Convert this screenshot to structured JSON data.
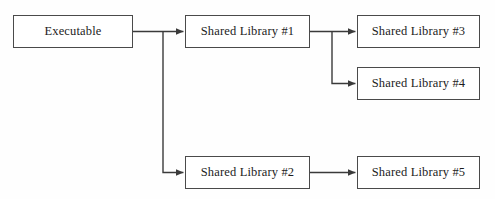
{
  "diagram": {
    "canvas": {
      "width": 495,
      "height": 199,
      "background": "#fefefe"
    },
    "style": {
      "box_border_color": "#4a4a4a",
      "box_fill_color": "#ffffff",
      "edge_color": "#3a3a3a",
      "text_color": "#1c1c1c",
      "edge_width": 1.4,
      "arrowhead": "solid-triangle"
    },
    "nodes": [
      {
        "id": "executable",
        "label": "Executable",
        "x": 13,
        "y": 15,
        "w": 120,
        "h": 33
      },
      {
        "id": "shared_library_1",
        "label": "Shared Library #1",
        "x": 185,
        "y": 15,
        "w": 125,
        "h": 33
      },
      {
        "id": "shared_library_3",
        "label": "Shared Library #3",
        "x": 357,
        "y": 15,
        "w": 123,
        "h": 33
      },
      {
        "id": "shared_library_4",
        "label": "Shared Library #4",
        "x": 357,
        "y": 67,
        "w": 123,
        "h": 33
      },
      {
        "id": "shared_library_2",
        "label": "Shared Library #2",
        "x": 185,
        "y": 156,
        "w": 125,
        "h": 33
      },
      {
        "id": "shared_library_5",
        "label": "Shared Library #5",
        "x": 357,
        "y": 156,
        "w": 123,
        "h": 33
      }
    ],
    "edges": [
      {
        "id": "edge-executable-to-sl1",
        "from": "executable",
        "to": "shared_library_1",
        "kind": "straight"
      },
      {
        "id": "edge-executable-to-sl2",
        "from": "executable",
        "to": "shared_library_2",
        "kind": "elbow-down"
      },
      {
        "id": "edge-sl1-to-sl3",
        "from": "shared_library_1",
        "to": "shared_library_3",
        "kind": "straight"
      },
      {
        "id": "edge-sl1-to-sl4",
        "from": "shared_library_1",
        "to": "shared_library_4",
        "kind": "elbow-down"
      },
      {
        "id": "edge-sl2-to-sl5",
        "from": "shared_library_2",
        "to": "shared_library_5",
        "kind": "straight"
      }
    ]
  }
}
